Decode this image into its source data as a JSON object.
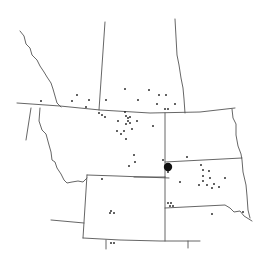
{
  "map": {
    "width": 268,
    "height": 266,
    "background": "#ffffff",
    "line_color": "#555555",
    "point_color": "#222222",
    "large_marker": {
      "x": 168,
      "y": 167,
      "r": 4.2,
      "color": "#111111"
    },
    "borders": [
      {
        "name": "canada-us-49th-parallel",
        "d": "M17,103 L60,106 L100,110 L150,113 L200,112 L235,108"
      },
      {
        "name": "alberta-bc-border",
        "d": "M20,31 L24,36 L26,44 L30,48 L32,55 L37,60 L40,66 L44,72 L47,77 L51,83 L53,89 L55,96 L57,103 L61,107"
      },
      {
        "name": "alberta-saskatchewan-border",
        "d": "M105,22 L99,110"
      },
      {
        "name": "saskatchewan-manitoba-border",
        "d": "M175,19 L177,55 L179,65 L181,78 L183,88 L184,99 L185,113"
      },
      {
        "name": "idaho-west-border",
        "d": "M31,108 L26,140"
      },
      {
        "name": "idaho-montana-border",
        "d": "M40,108 L39,121 L42,130 L46,134 L49,145 L51,152 L52,160 L55,162 L57,168 L61,174 L64,180 L67,183 L72,182 L78,181 L83,182 L87,178"
      },
      {
        "name": "montana-wyoming-north",
        "d": "M87,175 L117,176 L169,178"
      },
      {
        "name": "montana-dakota-border",
        "d": "M165,113 L165,177"
      },
      {
        "name": "wyoming-west-border",
        "d": "M87,175 L83,238"
      },
      {
        "name": "wyoming-south-border",
        "d": "M83,238 L120,240 L160,241 L200,241"
      },
      {
        "name": "idaho-utah-border",
        "d": "M51,220 L84,223"
      },
      {
        "name": "colorado-north-west-stub",
        "d": "M106,240 L106,249"
      },
      {
        "name": "colorado-east-stub",
        "d": "M188,241 L188,248"
      },
      {
        "name": "nebraska-west-border",
        "d": "M165,177 L165,241"
      },
      {
        "name": "north-dakota-south-border",
        "d": "M165,162 L242,158"
      },
      {
        "name": "south-dakota-south-border",
        "d": "M165,208 L225,205 L230,208 L234,212 L240,211 L244,216 L252,221"
      },
      {
        "name": "wyoming-nebraska-line",
        "d": "M165,177 L134,177"
      },
      {
        "name": "dakota-minnesota-east-border",
        "d": "M232,109 L233,118 L236,124 L236,135 L238,146 L241,154 L242,160 L243,172 L246,185 L247,196 L248,210 L250,218"
      }
    ],
    "points": [
      {
        "x": 41,
        "y": 101
      },
      {
        "x": 72,
        "y": 101
      },
      {
        "x": 77,
        "y": 95
      },
      {
        "x": 89,
        "y": 100
      },
      {
        "x": 86,
        "y": 107
      },
      {
        "x": 106,
        "y": 100
      },
      {
        "x": 99,
        "y": 113
      },
      {
        "x": 102,
        "y": 115
      },
      {
        "x": 105,
        "y": 117
      },
      {
        "x": 125,
        "y": 89
      },
      {
        "x": 149,
        "y": 90
      },
      {
        "x": 159,
        "y": 95
      },
      {
        "x": 138,
        "y": 100
      },
      {
        "x": 157,
        "y": 104
      },
      {
        "x": 165,
        "y": 109
      },
      {
        "x": 168,
        "y": 109
      },
      {
        "x": 175,
        "y": 104
      },
      {
        "x": 166,
        "y": 95
      },
      {
        "x": 137,
        "y": 121
      },
      {
        "x": 118,
        "y": 121
      },
      {
        "x": 125,
        "y": 112
      },
      {
        "x": 126,
        "y": 116
      },
      {
        "x": 128,
        "y": 118
      },
      {
        "x": 130,
        "y": 117
      },
      {
        "x": 128,
        "y": 121
      },
      {
        "x": 130,
        "y": 123
      },
      {
        "x": 126,
        "y": 124
      },
      {
        "x": 132,
        "y": 129
      },
      {
        "x": 117,
        "y": 131
      },
      {
        "x": 124,
        "y": 131
      },
      {
        "x": 121,
        "y": 134
      },
      {
        "x": 126,
        "y": 139
      },
      {
        "x": 153,
        "y": 126
      },
      {
        "x": 134,
        "y": 155
      },
      {
        "x": 135,
        "y": 162
      },
      {
        "x": 129,
        "y": 166
      },
      {
        "x": 102,
        "y": 179
      },
      {
        "x": 163,
        "y": 160
      },
      {
        "x": 168,
        "y": 172
      },
      {
        "x": 187,
        "y": 157
      },
      {
        "x": 201,
        "y": 165
      },
      {
        "x": 203,
        "y": 170
      },
      {
        "x": 209,
        "y": 171
      },
      {
        "x": 203,
        "y": 176
      },
      {
        "x": 210,
        "y": 178
      },
      {
        "x": 203,
        "y": 181
      },
      {
        "x": 207,
        "y": 185
      },
      {
        "x": 214,
        "y": 184
      },
      {
        "x": 225,
        "y": 178
      },
      {
        "x": 199,
        "y": 185
      },
      {
        "x": 212,
        "y": 188
      },
      {
        "x": 219,
        "y": 187
      },
      {
        "x": 180,
        "y": 182
      },
      {
        "x": 212,
        "y": 214
      },
      {
        "x": 243,
        "y": 212
      },
      {
        "x": 111,
        "y": 211
      },
      {
        "x": 110,
        "y": 213
      },
      {
        "x": 114,
        "y": 213
      },
      {
        "x": 168,
        "y": 203
      },
      {
        "x": 171,
        "y": 203
      },
      {
        "x": 170,
        "y": 206
      },
      {
        "x": 173,
        "y": 206
      },
      {
        "x": 111,
        "y": 243
      },
      {
        "x": 114,
        "y": 243
      }
    ]
  }
}
